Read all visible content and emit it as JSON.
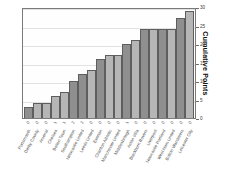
{
  "chart_data": {
    "type": "bar",
    "title": "",
    "subtitle": "",
    "xlabel": "",
    "ylabel": "Cumulative Points",
    "ylim": [
      0,
      30
    ],
    "yticks": [
      0,
      5,
      10,
      15,
      20,
      25,
      30
    ],
    "grid": true,
    "legend": null,
    "categories": [
      "Portsmouth",
      "Derby County",
      "Arsenal",
      "Chelsea",
      "Bolton Town",
      "Southampton",
      "Newcastle United",
      "Leeds United",
      "Everton",
      "Charlton Athletic",
      "Manchester United",
      "Middlesbrough",
      "Aston Villa",
      "Blackburn Rovers",
      "Liverpool",
      "Newcastle Portland",
      "West Ham United",
      "Bolton Wanderers",
      "Leicester City"
    ],
    "values": [
      3,
      4,
      4,
      6,
      7,
      10,
      12,
      13,
      16,
      17,
      17,
      20,
      21,
      24,
      24,
      24,
      24,
      27,
      29
    ],
    "bar_styles": [
      "dark",
      "light",
      "light",
      "light",
      "light",
      "dark",
      "dark",
      "light",
      "dark",
      "light",
      "light",
      "dark",
      "light",
      "dark",
      "light",
      "dark",
      "light",
      "dark",
      "light"
    ],
    "point_labels": [
      "0",
      "0",
      "0",
      "1",
      "1",
      "2",
      "2",
      "0",
      "0",
      "0",
      "0",
      "1",
      "0",
      "0",
      "0",
      "0",
      "0",
      "0",
      "0"
    ]
  },
  "axis": {
    "y_title": "Cumulative Points"
  }
}
